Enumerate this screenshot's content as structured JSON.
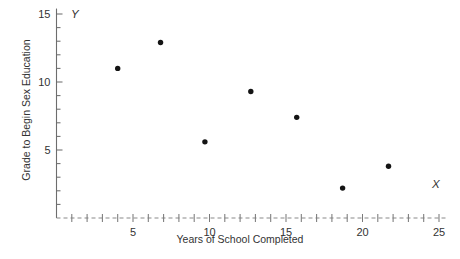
{
  "chart_data": {
    "type": "scatter",
    "title": "",
    "xlabel": "Years of School Completed",
    "ylabel": "Grade to Begin Sex Education",
    "x_axis_letter": "X",
    "y_axis_letter": "Y",
    "xlim": [
      0,
      25.6
    ],
    "ylim": [
      0,
      15.4
    ],
    "x_ticks": [
      5,
      10,
      15,
      20,
      25
    ],
    "x_tick_labels": [
      "5",
      "10",
      "15",
      "20",
      "25"
    ],
    "x_minor_tick_step": 1,
    "y_ticks": [
      5,
      10,
      15
    ],
    "y_tick_labels": [
      "5",
      "10",
      "15"
    ],
    "y_minor_tick_step": 1,
    "grid": false,
    "legend": null,
    "x": [
      4.0,
      6.8,
      9.7,
      12.7,
      15.7,
      18.7,
      21.7
    ],
    "y": [
      11.0,
      12.9,
      5.6,
      9.3,
      7.4,
      2.2,
      3.8
    ],
    "points": [
      {
        "x": 4.0,
        "y": 11.0
      },
      {
        "x": 6.8,
        "y": 12.9
      },
      {
        "x": 9.7,
        "y": 5.6
      },
      {
        "x": 12.7,
        "y": 9.3
      },
      {
        "x": 15.7,
        "y": 7.4
      },
      {
        "x": 18.7,
        "y": 2.2
      },
      {
        "x": 21.7,
        "y": 3.8
      }
    ],
    "marker": "filled-circle",
    "marker_color": "#141414",
    "axis_color": "#6d6d6d",
    "x_axis_style": "dashed-with-crossing-ticks"
  },
  "labels": {
    "y_axis_title": "Grade to Begin Sex Education",
    "x_axis_title": "Years of School Completed",
    "y_letter": "Y",
    "x_letter": "X"
  }
}
